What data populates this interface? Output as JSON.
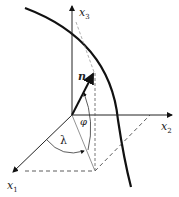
{
  "diagram": {
    "type": "3D coordinate system with unit normal vector on a curved surface",
    "axes": [
      {
        "id": "x1",
        "label": "x",
        "sub": "1"
      },
      {
        "id": "x2",
        "label": "x",
        "sub": "2"
      },
      {
        "id": "x3",
        "label": "x",
        "sub": "3"
      }
    ],
    "vector": {
      "label": "n"
    },
    "angles": [
      {
        "label": "λ"
      },
      {
        "label": "φ"
      }
    ],
    "colors": {
      "line": "#111111",
      "dashed": "#444444",
      "light_dashed": "#999999"
    }
  }
}
